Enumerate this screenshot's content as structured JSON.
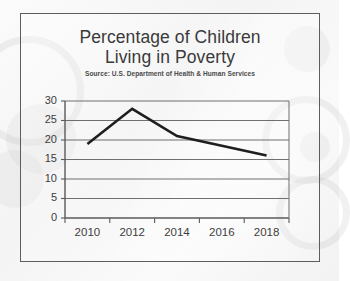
{
  "chart_data": {
    "type": "line",
    "title": "Percentage of Children Living in Poverty",
    "title_line1": "Percentage of Children",
    "title_line2": "Living in Poverty",
    "subtitle": "Source: U.S. Department of Health & Human Services",
    "xlabel": "",
    "ylabel": "",
    "categories": [
      "2010",
      "2012",
      "2014",
      "2016",
      "2018"
    ],
    "values": [
      19,
      28,
      21,
      18.5,
      16
    ],
    "series": [
      {
        "name": "Percentage of children living in poverty",
        "values": [
          19,
          28,
          21,
          18.5,
          16
        ]
      }
    ],
    "ylim": [
      0,
      30
    ],
    "ytick_step": 5,
    "yticks": [
      "30",
      "25",
      "20",
      "15",
      "10",
      "5",
      "0"
    ],
    "xticks": [
      "2010",
      "2012",
      "2014",
      "2016",
      "2018"
    ],
    "grid": true,
    "grid_axis": "y",
    "legend": false,
    "legend_position": "none",
    "line_color": "#1e1e1e",
    "grid_color": "#6f6f6f",
    "axis_color": "#5a5a5a",
    "text_color": "#3a3a3a",
    "background_color": "#f5f5f5"
  }
}
